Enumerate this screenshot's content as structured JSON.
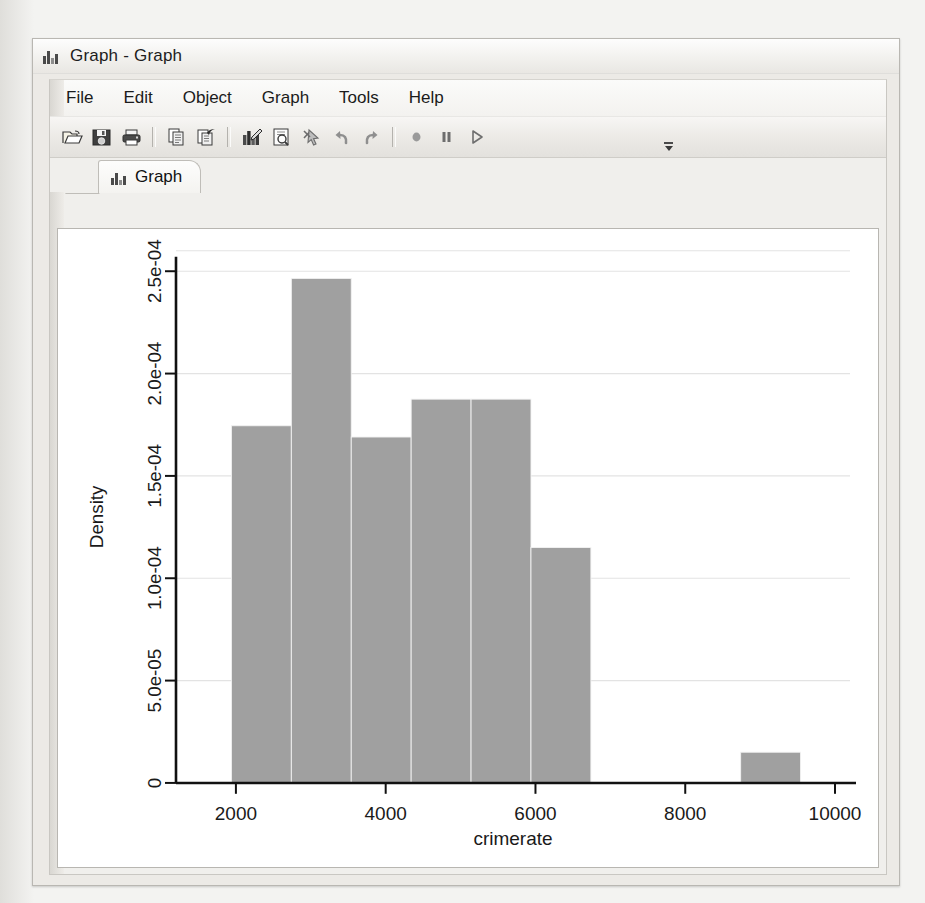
{
  "window": {
    "title": "Graph - Graph",
    "title_icon": "bar-chart-icon"
  },
  "menu": {
    "items": [
      {
        "label": "File"
      },
      {
        "label": "Edit"
      },
      {
        "label": "Object"
      },
      {
        "label": "Graph"
      },
      {
        "label": "Tools"
      },
      {
        "label": "Help"
      }
    ]
  },
  "toolbar": {
    "buttons": [
      {
        "name": "open-icon",
        "tip": "Open"
      },
      {
        "name": "save-icon",
        "tip": "Save"
      },
      {
        "name": "print-icon",
        "tip": "Print"
      },
      {
        "name": "separator-1",
        "tip": ""
      },
      {
        "name": "copy-icon",
        "tip": "Copy"
      },
      {
        "name": "paste-icon",
        "tip": "Paste"
      },
      {
        "name": "separator-2",
        "tip": ""
      },
      {
        "name": "graph-editor-icon",
        "tip": "Start Graph Editor"
      },
      {
        "name": "preview-icon",
        "tip": "Preview"
      },
      {
        "name": "pointer-tool-icon",
        "tip": "Pointer tool"
      },
      {
        "name": "undo-icon",
        "tip": "Undo"
      },
      {
        "name": "redo-icon",
        "tip": "Redo"
      },
      {
        "name": "separator-3",
        "tip": ""
      },
      {
        "name": "record-icon",
        "tip": "Record"
      },
      {
        "name": "pause-icon",
        "tip": "Pause"
      },
      {
        "name": "play-icon",
        "tip": "Play"
      }
    ],
    "overflow_label": "»"
  },
  "tabs": [
    {
      "label": "Graph",
      "icon": "bar-chart-icon",
      "active": true
    }
  ],
  "chart_data": {
    "type": "bar",
    "subtype": "histogram",
    "title": "",
    "xlabel": "crimerate",
    "ylabel": "Density",
    "grid": "horizontal",
    "legend": "none",
    "bar_color": "#a0a0a0",
    "plot_background": "#ffffff",
    "xlim": [
      1200,
      10200
    ],
    "ylim": [
      0,
      0.00026
    ],
    "xticks": [
      2000,
      4000,
      6000,
      8000,
      10000
    ],
    "xticklabels": [
      "2000",
      "4000",
      "6000",
      "8000",
      "10000"
    ],
    "yticks": [
      0,
      5e-05,
      0.0001,
      0.00015,
      0.0002,
      0.00025
    ],
    "yticklabels": [
      "0",
      "5.0e-05",
      "1.0e-04",
      "1.5e-04",
      "2.0e-04",
      "2.5e-04"
    ],
    "bins": [
      {
        "x0": 1940,
        "x1": 2740,
        "density": 0.0001745
      },
      {
        "x0": 2740,
        "x1": 3540,
        "density": 0.0002465
      },
      {
        "x0": 3540,
        "x1": 4340,
        "density": 0.000169
      },
      {
        "x0": 4340,
        "x1": 5140,
        "density": 0.0001875
      },
      {
        "x0": 5140,
        "x1": 5940,
        "density": 0.0001875
      },
      {
        "x0": 5940,
        "x1": 6740,
        "density": 0.000115
      },
      {
        "x0": 8740,
        "x1": 9540,
        "density": 1.5e-05
      }
    ]
  }
}
